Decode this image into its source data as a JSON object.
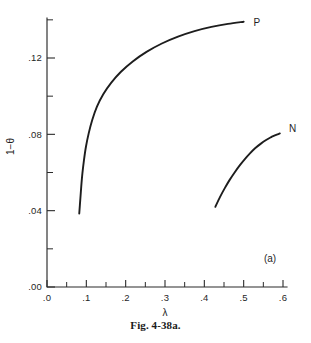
{
  "figure": {
    "caption": "Fig. 4-38a.",
    "panel_label": "(a)"
  },
  "chart_data": {
    "type": "line",
    "title": "",
    "subtitle": "",
    "xlabel": "λ",
    "ylabel": "1−θ",
    "xlim": [
      0.0,
      0.64
    ],
    "ylim": [
      0.0,
      0.1412
    ],
    "grid": false,
    "legend": "inline-end-labels",
    "x_ticks": [
      0.0,
      0.1,
      0.2,
      0.3,
      0.4,
      0.5,
      0.6
    ],
    "x_tick_labels": [
      ".0",
      ".1",
      ".2",
      ".3",
      ".4",
      ".5",
      ".6"
    ],
    "x_minor_ticks": [
      0.05,
      0.15,
      0.25,
      0.35,
      0.45,
      0.55
    ],
    "y_ticks": [
      0.0,
      0.04,
      0.08,
      0.12
    ],
    "y_tick_labels": [
      ".00",
      ".04",
      ".08",
      ".12"
    ],
    "y_minor_ticks": [
      0.02,
      0.06,
      0.1,
      0.14
    ],
    "series": [
      {
        "name": "P",
        "label": "P",
        "label_x": 0.525,
        "label_y": 0.1385,
        "points": [
          [
            0.082,
            0.0385
          ],
          [
            0.0845,
            0.0455
          ],
          [
            0.087,
            0.0525
          ],
          [
            0.09,
            0.0595
          ],
          [
            0.094,
            0.0665
          ],
          [
            0.099,
            0.0735
          ],
          [
            0.106,
            0.0805
          ],
          [
            0.115,
            0.0875
          ],
          [
            0.127,
            0.0945
          ],
          [
            0.143,
            0.101
          ],
          [
            0.163,
            0.107
          ],
          [
            0.188,
            0.1128
          ],
          [
            0.218,
            0.1182
          ],
          [
            0.253,
            0.1232
          ],
          [
            0.292,
            0.1276
          ],
          [
            0.333,
            0.1312
          ],
          [
            0.375,
            0.1341
          ],
          [
            0.418,
            0.1363
          ],
          [
            0.46,
            0.1379
          ],
          [
            0.5,
            0.139
          ]
        ]
      },
      {
        "name": "N",
        "label": "N",
        "label_x": 0.615,
        "label_y": 0.0828,
        "points": [
          [
            0.428,
            0.042
          ],
          [
            0.44,
            0.0472
          ],
          [
            0.452,
            0.0518
          ],
          [
            0.464,
            0.056
          ],
          [
            0.477,
            0.06
          ],
          [
            0.49,
            0.0637
          ],
          [
            0.503,
            0.067
          ],
          [
            0.516,
            0.07
          ],
          [
            0.529,
            0.0727
          ],
          [
            0.543,
            0.075
          ],
          [
            0.557,
            0.077
          ],
          [
            0.571,
            0.0787
          ],
          [
            0.572,
            0.0788
          ],
          [
            0.586,
            0.08
          ],
          [
            0.592,
            0.0805
          ]
        ]
      }
    ]
  }
}
